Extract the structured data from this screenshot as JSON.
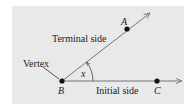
{
  "diagram": {
    "type": "angle",
    "labels": {
      "terminal_side": "Terminal side",
      "initial_side": "Initial side",
      "vertex": "Vertex",
      "point_a": "A",
      "point_b": "B",
      "point_c": "C",
      "angle": "x"
    },
    "colors": {
      "background": "#e9e9e9",
      "ray": "#777777",
      "point": "#111111",
      "text": "#222222"
    }
  }
}
